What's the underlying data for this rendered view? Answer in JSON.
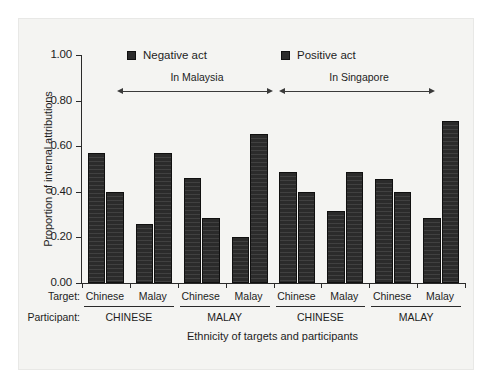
{
  "chart_data": {
    "type": "bar",
    "title": "",
    "xlabel": "Ethnicity of targets and participants",
    "ylabel": "Proportion of internal attributions",
    "ylim": [
      0.0,
      1.0
    ],
    "yticks": [
      "0.00",
      "0.20",
      "0.40",
      "0.60",
      "0.80",
      "1.00"
    ],
    "ytick_values": [
      0.0,
      0.2,
      0.4,
      0.6,
      0.8,
      1.0
    ],
    "grid": false,
    "legend_position": "top-inside",
    "legend": [
      "Negative act",
      "Positive act"
    ],
    "categories": [
      "In Malaysia / CHINESE participant / Chinese target",
      "In Malaysia / CHINESE participant / Malay target",
      "In Malaysia / MALAY participant / Chinese target",
      "In Malaysia / MALAY participant / Malay target",
      "In Singapore / CHINESE participant / Chinese target",
      "In Singapore / CHINESE participant / Malay target",
      "In Singapore / MALAY participant / Chinese target",
      "In Singapore / MALAY participant / Malay target"
    ],
    "series": [
      {
        "name": "Negative act",
        "values": [
          0.57,
          0.26,
          0.46,
          0.2,
          0.485,
          0.315,
          0.455,
          0.285
        ]
      },
      {
        "name": "Positive act",
        "values": [
          0.4,
          0.57,
          0.285,
          0.655,
          0.4,
          0.485,
          0.4,
          0.71
        ]
      }
    ],
    "annotations": [
      {
        "text": "In Malaysia",
        "type": "double-arrow-span",
        "covers_groups": [
          0,
          1
        ]
      },
      {
        "text": "In Singapore",
        "type": "double-arrow-span",
        "covers_groups": [
          2,
          3
        ]
      }
    ],
    "axis_categories": {
      "row1_title": "Target:",
      "row1_values": [
        "Chinese",
        "Malay",
        "Chinese",
        "Malay",
        "Chinese",
        "Malay",
        "Chinese",
        "Malay"
      ],
      "row2_title": "Participant:",
      "row2_values": [
        "CHINESE",
        "MALAY",
        "CHINESE",
        "MALAY"
      ]
    },
    "colors": {
      "bar": "#2b2b2b",
      "axis": "#2a2a2a",
      "panel_background": "#f4f4f2",
      "page_background": "#ffffff",
      "text": "#1d1d1d"
    }
  }
}
